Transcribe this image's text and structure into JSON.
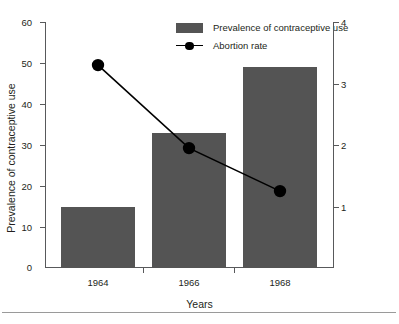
{
  "chart_data": {
    "type": "bar",
    "title": "",
    "subtitle": "",
    "categories": [
      "1964",
      "1966",
      "1968"
    ],
    "xlabel": "Years",
    "ylabel": "Prevalence of contraceptive use",
    "ylabel_right": "Abortion rate x 100 women 15–44 years old",
    "ylim": [
      0,
      60
    ],
    "ylim_right": [
      0,
      4
    ],
    "yticks": [
      0,
      10,
      20,
      30,
      40,
      50,
      60
    ],
    "yticks_right": [
      1,
      2,
      3,
      4
    ],
    "grid": false,
    "legend_position": "top-center",
    "series": [
      {
        "name": "Prevalence of contraceptive use",
        "type": "bar",
        "axis": "left",
        "color": "#545454",
        "values": [
          15,
          33,
          49
        ]
      },
      {
        "name": "Abortion rate",
        "type": "line",
        "axis": "right",
        "color": "#000000",
        "marker": "circle",
        "values": [
          3.3,
          1.95,
          1.25
        ]
      }
    ]
  },
  "axes": {
    "left": {
      "title": "Prevalence of contraceptive use",
      "tick_labels": [
        "60",
        "50",
        "40",
        "30",
        "20",
        "10",
        "0"
      ]
    },
    "right": {
      "title": "Abortion rate x 100 women 15–44 years old",
      "tick_labels": [
        "4",
        "3",
        "2",
        "1"
      ]
    },
    "bottom": {
      "title": "Years",
      "tick_labels": [
        "1964",
        "1966",
        "1968"
      ]
    }
  },
  "legend": {
    "items": [
      {
        "label": "Prevalence of contraceptive use",
        "marker": "bar-swatch",
        "color": "#545454"
      },
      {
        "label": "Abortion rate",
        "marker": "line-dot",
        "color": "#000000"
      }
    ]
  },
  "colors": {
    "bar_fill": "#545454",
    "line": "#000000",
    "axis": "#58595b",
    "text": "#231f20",
    "rule": "#9a9a9a",
    "background": "#ffffff"
  }
}
